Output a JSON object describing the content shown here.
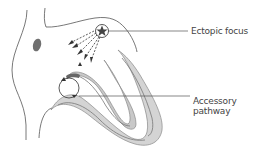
{
  "diagram": {
    "type": "anatomical-heart-cross-section",
    "labels": [
      {
        "id": "ectopic_focus",
        "text": "Ectopic focus"
      },
      {
        "id": "accessory_pathway_line1",
        "text": "Accessory"
      },
      {
        "id": "accessory_pathway_line2",
        "text": "pathway"
      }
    ],
    "colors": {
      "outline": "#555555",
      "myocardium_fill": "#d4d4d4",
      "myocardium_stroke": "#888888",
      "node_fill": "#707070",
      "arrow": "#333333",
      "leader_line": "#555555",
      "label_text": "#444444"
    }
  }
}
